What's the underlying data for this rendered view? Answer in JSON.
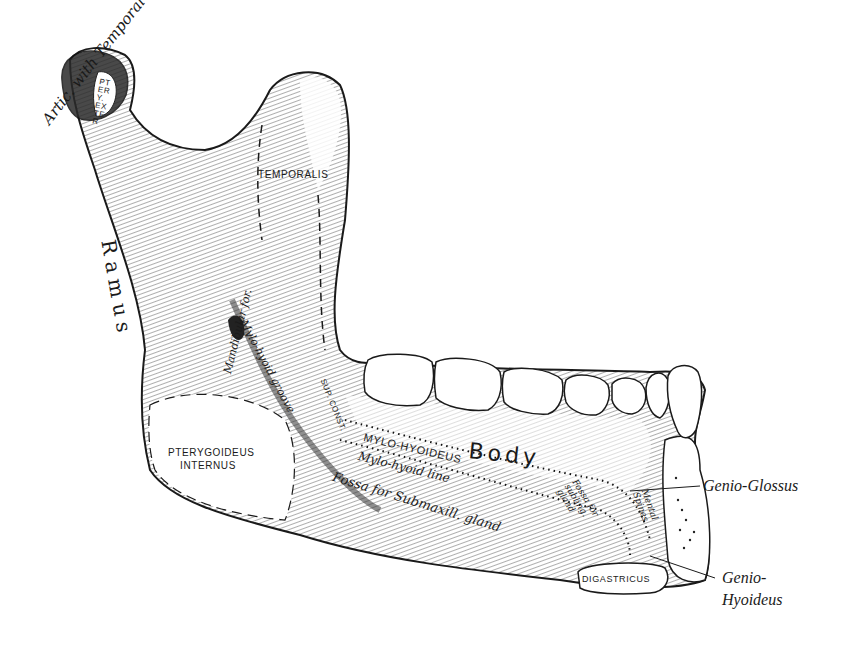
{
  "figure": {
    "colors": {
      "ink": "#1a1a1a",
      "paper": "#ffffff"
    }
  },
  "labels": {
    "artic_with_temporal": "Artic. with Temporal",
    "ptery_exter": "PTERY. EXTER",
    "temporalis": "TEMPORALIS",
    "ramus": "Ramus",
    "mandibular_for": "Mandibular for.",
    "mylo_hyoid_groove": "Mylo-hyoid groove",
    "pterygoideus_internus_1": "PTERYGOIDEUS",
    "pterygoideus_internus_2": "INTERNUS",
    "sup_const": "SUP. CONST.",
    "mylo_hyoideus": "MYLO-HYOIDEUS",
    "body": "Body",
    "mylo_hyoid_line": "Mylo-hyoid line",
    "fossa_submaxill": "Fossa for Submaxill. gland",
    "fossa_subling": "Fossa for subling. gland",
    "mental_spines": "Mental Spines",
    "digastricus": "DIGASTRICUS",
    "genio_glossus": "Genio-Glossus",
    "genio_hyoideus_1": "Genio-",
    "genio_hyoideus_2": "Hyoideus"
  }
}
